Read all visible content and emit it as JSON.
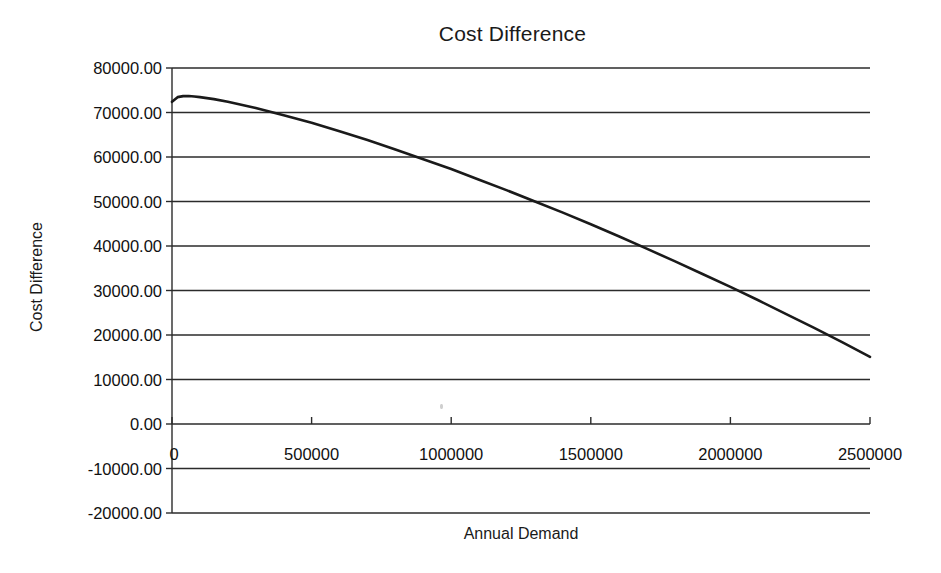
{
  "figure": {
    "width": 941,
    "height": 573,
    "background": "#ffffff",
    "line_color": "#1a1a1a",
    "grid_color": "#2b2b2b",
    "text_color": "#111111"
  },
  "chart_data": {
    "type": "line",
    "title": "Cost Difference",
    "xlabel": "Annual Demand",
    "ylabel": "Cost Difference",
    "xlim": [
      0,
      2500000
    ],
    "ylim": [
      -20000,
      80000
    ],
    "grid": true,
    "grid_axis": "y",
    "legend": false,
    "legend_position": "none",
    "xtick_labels": [
      "0",
      "500000",
      "1000000",
      "1500000",
      "2000000",
      "2500000"
    ],
    "xticks": [
      0,
      500000,
      1000000,
      1500000,
      2000000,
      2500000
    ],
    "ytick_labels": [
      "80000.00",
      "70000.00",
      "60000.00",
      "50000.00",
      "40000.00",
      "30000.00",
      "20000.00",
      "10000.00",
      "0.00",
      "-10000.00",
      "-20000.00"
    ],
    "yticks": [
      80000,
      70000,
      60000,
      50000,
      40000,
      30000,
      20000,
      10000,
      0,
      -10000,
      -20000
    ],
    "series": [
      {
        "name": "Cost Difference",
        "x": [
          0,
          20000,
          40000,
          60000,
          80000,
          100000,
          150000,
          200000,
          300000,
          400000,
          500000,
          600000,
          700000,
          800000,
          900000,
          1000000,
          1100000,
          1200000,
          1300000,
          1400000,
          1500000,
          1600000,
          1700000,
          1800000,
          1900000,
          2000000,
          2100000,
          2200000,
          2300000,
          2400000,
          2500000
        ],
        "y": [
          72400,
          73450,
          73680,
          73700,
          73600,
          73450,
          73000,
          72400,
          71000,
          69400,
          67700,
          65800,
          63800,
          61700,
          59500,
          57300,
          54900,
          52500,
          50000,
          47500,
          44900,
          42200,
          39400,
          36600,
          33700,
          30800,
          27800,
          24700,
          21600,
          18400,
          15100
        ]
      }
    ],
    "annotations": []
  }
}
